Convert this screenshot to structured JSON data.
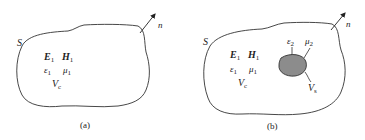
{
  "panels": [
    {
      "id": "a",
      "caption": "(a)",
      "surface_label": "S",
      "normal_label": "n",
      "fields": {
        "E": "E",
        "E_sub": "1",
        "H": "H",
        "H_sub": "1"
      },
      "params": {
        "eps": "ε",
        "eps_sub": "1",
        "mu": "μ",
        "mu_sub": "1"
      },
      "volume": {
        "V": "V",
        "V_sub": "c"
      }
    },
    {
      "id": "b",
      "caption": "(b)",
      "surface_label": "S",
      "normal_label": "n",
      "fields": {
        "E": "E",
        "E_sub": "1",
        "H": "H",
        "H_sub": "1"
      },
      "params": {
        "eps": "ε",
        "eps_sub": "1",
        "mu": "μ",
        "mu_sub": "1"
      },
      "volume": {
        "V": "V",
        "V_sub": "c"
      },
      "inclusion": {
        "eps": "ε",
        "eps_sub": "2",
        "mu": "μ",
        "mu_sub": "2",
        "V": "V",
        "V_sub": "s",
        "fill_color": "#8c8c8c"
      }
    }
  ],
  "colors": {
    "line": "#333333",
    "text": "#222222",
    "inclusion_fill": "#8c8c8c"
  }
}
